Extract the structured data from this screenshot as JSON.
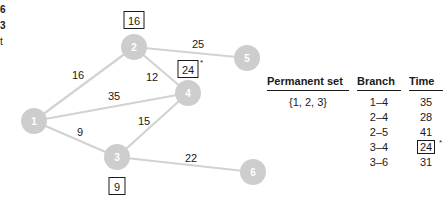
{
  "cut_text": [
    "6",
    "3",
    "t"
  ],
  "graph": {
    "nodes": [
      {
        "id": "1",
        "label": "1",
        "x": 34,
        "y": 121
      },
      {
        "id": "2",
        "label": "2",
        "x": 134,
        "y": 47
      },
      {
        "id": "3",
        "label": "3",
        "x": 117,
        "y": 157
      },
      {
        "id": "4",
        "label": "4",
        "x": 188,
        "y": 93
      },
      {
        "id": "5",
        "label": "5",
        "x": 247,
        "y": 58
      },
      {
        "id": "6",
        "label": "6",
        "x": 253,
        "y": 172
      }
    ],
    "edges": [
      {
        "from": "1",
        "to": "2",
        "weight": "16",
        "lx": 78,
        "ly": 75
      },
      {
        "from": "1",
        "to": "4",
        "weight": "35",
        "lx": 114,
        "ly": 96
      },
      {
        "from": "1",
        "to": "3",
        "weight": "9",
        "lx": 80,
        "ly": 132
      },
      {
        "from": "2",
        "to": "4",
        "weight": "12",
        "lx": 152,
        "ly": 77
      },
      {
        "from": "2",
        "to": "5",
        "weight": "25",
        "lx": 198,
        "ly": 44
      },
      {
        "from": "3",
        "to": "4",
        "weight": "15",
        "lx": 144,
        "ly": 121
      },
      {
        "from": "3",
        "to": "6",
        "weight": "22",
        "lx": 191,
        "ly": 158
      }
    ],
    "boxed_labels": [
      {
        "node": "2",
        "value": "16",
        "x": 134,
        "y": 20,
        "starred": false
      },
      {
        "node": "4",
        "value": "24",
        "x": 188,
        "y": 69,
        "starred": true
      },
      {
        "node": "3",
        "value": "9",
        "x": 117,
        "y": 186,
        "starred": false
      }
    ]
  },
  "table": {
    "headers": [
      "Permanent set",
      "Branch",
      "Time"
    ],
    "permanent_set": "{1, 2, 3}",
    "rows": [
      {
        "branch": "1–4",
        "time": "35",
        "boxed": false
      },
      {
        "branch": "2–4",
        "time": "28",
        "boxed": false
      },
      {
        "branch": "2–5",
        "time": "41",
        "boxed": false
      },
      {
        "branch": "3–4",
        "time": "24",
        "boxed": true,
        "star": "*"
      },
      {
        "branch": "3–6",
        "time": "31",
        "boxed": false
      }
    ]
  },
  "colors": {
    "node_fill": "#cdcdcd",
    "edge": "#d2d2d2",
    "text": "#1a1a1a"
  }
}
